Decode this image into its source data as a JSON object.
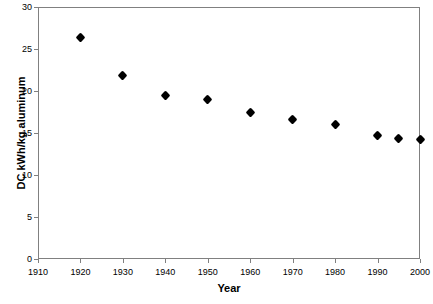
{
  "chart_data": {
    "type": "scatter",
    "title": "",
    "xlabel": "Year",
    "ylabel": "DC kWh/kg aluminum",
    "xlim": [
      1910,
      2000
    ],
    "ylim": [
      0,
      30
    ],
    "xticks": [
      1910,
      1920,
      1930,
      1940,
      1950,
      1960,
      1970,
      1980,
      1990,
      2000
    ],
    "yticks": [
      0,
      5,
      10,
      15,
      20,
      25,
      30
    ],
    "grid": false,
    "legend": null,
    "marker": "diamond",
    "marker_color": "#000000",
    "x": [
      1920,
      1930,
      1940,
      1950,
      1960,
      1970,
      1980,
      1990,
      1995,
      2000
    ],
    "values": [
      26.4,
      21.9,
      19.5,
      19.0,
      17.4,
      16.6,
      16.0,
      14.7,
      14.4,
      14.2
    ],
    "points": [
      {
        "x": 1920,
        "y": 26.4
      },
      {
        "x": 1930,
        "y": 21.9
      },
      {
        "x": 1940,
        "y": 19.5
      },
      {
        "x": 1950,
        "y": 19.0
      },
      {
        "x": 1960,
        "y": 17.4
      },
      {
        "x": 1970,
        "y": 16.6
      },
      {
        "x": 1980,
        "y": 16.0
      },
      {
        "x": 1990,
        "y": 14.7
      },
      {
        "x": 1995,
        "y": 14.4
      },
      {
        "x": 2000,
        "y": 14.2
      }
    ]
  },
  "axes": {
    "y_title": "DC kWh/kg aluminum",
    "x_title": "Year",
    "y_tick_labels": [
      "30",
      "25",
      "20",
      "15",
      "10",
      "5",
      "0"
    ],
    "x_tick_labels": [
      "1910",
      "1920",
      "1930",
      "1940",
      "1950",
      "1960",
      "1970",
      "1980",
      "1990",
      "2000"
    ]
  },
  "colors": {
    "frame": "#808080",
    "marker": "#000000",
    "background": "#ffffff",
    "text": "#000000"
  }
}
